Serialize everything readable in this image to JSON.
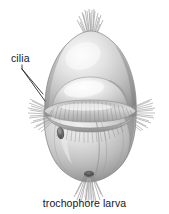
{
  "figure": {
    "background_color": "#ffffff",
    "caption": "trochophore larva",
    "labels": [
      {
        "id": "cilia",
        "text": "cilia",
        "color": "#1a1a1a",
        "leader_lines": 2
      }
    ],
    "structures": [
      {
        "name": "apical-tuft",
        "description": "tuft of cilia at top pole"
      },
      {
        "name": "episphere",
        "description": "upper hemisphere of body"
      },
      {
        "name": "prototroch",
        "description": "equatorial band of cilia"
      },
      {
        "name": "mouth",
        "description": "dark opening below ciliary band on left"
      },
      {
        "name": "hyposphere",
        "description": "lower hemisphere of body"
      },
      {
        "name": "posterior-tuft",
        "description": "tuft of cilia at bottom pole"
      }
    ],
    "palette": {
      "body_light": "#f2f2f2",
      "body_mid": "#c9c9c9",
      "body_dark": "#8e8e8e",
      "body_shadow": "#6e6e6e",
      "cilia": "#9a9a9a",
      "outline": "#7a7a7a",
      "text": "#1a1a1a"
    }
  }
}
